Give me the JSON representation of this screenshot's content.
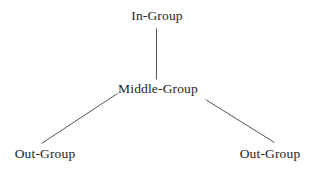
{
  "diagram": {
    "background_color": "#ffffff",
    "line_color": "#555555",
    "text_color": "#242424",
    "nodes": [
      {
        "id": "in-group",
        "label": "In-Group",
        "level": "top"
      },
      {
        "id": "middle-group",
        "label": "Middle-Group",
        "level": "middle"
      },
      {
        "id": "out-group-left",
        "label": "Out-Group",
        "level": "bottom"
      },
      {
        "id": "out-group-right",
        "label": "Out-Group",
        "level": "bottom"
      }
    ],
    "edges": [
      {
        "id": "edge-in-to-middle",
        "from": "in-group",
        "to": "middle-group",
        "shape": "vertical"
      },
      {
        "id": "edge-middle-to-out-left",
        "from": "middle-group",
        "to": "out-group-left",
        "shape": "diagonal"
      },
      {
        "id": "edge-middle-to-out-right",
        "from": "middle-group",
        "to": "out-group-right",
        "shape": "diagonal"
      }
    ]
  }
}
